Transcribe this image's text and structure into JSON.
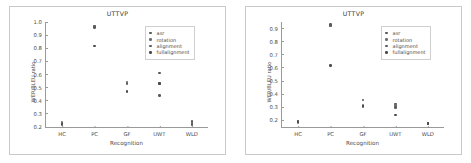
{
  "figure": {
    "background": "#ffffff",
    "panel_count": 2
  },
  "legend": {
    "position": "upper-right",
    "entries": [
      {
        "label": "asr",
        "color": "#555555"
      },
      {
        "label": "rotation",
        "color": "#6d6d6d"
      },
      {
        "label": "alignment",
        "color": "#5a5a5a"
      },
      {
        "label": "fullalignment",
        "color": "#4a4a4a"
      }
    ]
  },
  "chart_data": [
    {
      "type": "scatter",
      "panel": "left",
      "title": "UTTVP",
      "xlabel": "Recognition",
      "ylabel": "WER/BLEU ratio",
      "categories": [
        "HC",
        "PC",
        "GF",
        "UWT",
        "WLD"
      ],
      "ylim": [
        0.2,
        1.0
      ],
      "yticks": [
        0.2,
        0.3,
        0.4,
        0.5,
        0.6,
        0.7,
        0.8,
        0.9,
        1.0
      ],
      "ytick_labels": [
        "0.2",
        "0.3",
        "0.4",
        "0.5",
        "0.6",
        "0.7",
        "0.8",
        "0.9",
        "1.0"
      ],
      "grid": false,
      "series": [
        {
          "name": "asr",
          "values": [
            0.225,
            0.965,
            0.535,
            0.61,
            0.24
          ]
        },
        {
          "name": "rotation",
          "values": [
            0.235,
            0.97,
            0.54,
            0.53,
            0.232
          ]
        },
        {
          "name": "alignment",
          "values": [
            0.215,
            0.96,
            0.528,
            0.44,
            0.222
          ]
        },
        {
          "name": "fullalignment",
          "values": [
            0.222,
            0.818,
            0.472,
            0.533,
            0.215
          ]
        }
      ]
    },
    {
      "type": "scatter",
      "panel": "right",
      "title": "UTTVP",
      "xlabel": "Recognition",
      "ylabel": "WER/BLEU ratio",
      "categories": [
        "HC",
        "PC",
        "GF",
        "UWT",
        "WLD"
      ],
      "ylim": [
        0.15,
        0.95
      ],
      "yticks": [
        0.2,
        0.3,
        0.4,
        0.5,
        0.6,
        0.7,
        0.8,
        0.9
      ],
      "ytick_labels": [
        "0.2",
        "0.3",
        "0.4",
        "0.5",
        "0.6",
        "0.7",
        "0.8",
        "0.9"
      ],
      "grid": false,
      "series": [
        {
          "name": "asr",
          "values": [
            0.19,
            0.925,
            0.355,
            0.325,
            0.18
          ]
        },
        {
          "name": "rotation",
          "values": [
            0.186,
            0.918,
            0.315,
            0.312,
            0.175
          ]
        },
        {
          "name": "alignment",
          "values": [
            0.192,
            0.93,
            0.305,
            0.3,
            0.172
          ]
        },
        {
          "name": "fullalignment",
          "values": [
            0.188,
            0.62,
            0.31,
            0.24,
            0.178
          ]
        }
      ]
    }
  ]
}
